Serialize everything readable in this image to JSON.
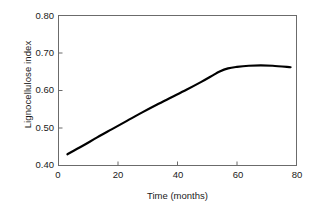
{
  "chart_data": {
    "type": "line",
    "title": "",
    "subtitle": "",
    "xlabel": "Time (months)",
    "ylabel": "Lignocellulose index",
    "xlim": [
      0,
      80
    ],
    "ylim": [
      0.4,
      0.8
    ],
    "xticks": [
      0,
      20,
      40,
      60,
      80
    ],
    "xtick_labels": [
      "0",
      "20",
      "40",
      "60",
      "80"
    ],
    "yticks": [
      0.4,
      0.5,
      0.6,
      0.7,
      0.8
    ],
    "ytick_labels": [
      "0.40",
      "0.50",
      "0.60",
      "0.70",
      "0.80"
    ],
    "grid": false,
    "legend": null,
    "legend_position": "none",
    "annotations": [],
    "line_color": "#000000",
    "line_width": 2.2,
    "axis_color": "#6b6b6b",
    "series": [
      {
        "name": "Lignocellulose index",
        "x": [
          3,
          8,
          13,
          18,
          23,
          28,
          33,
          38,
          43,
          48,
          52,
          54,
          57,
          60,
          64,
          68,
          72,
          78
        ],
        "y": [
          0.43,
          0.452,
          0.475,
          0.497,
          0.519,
          0.541,
          0.562,
          0.582,
          0.602,
          0.623,
          0.641,
          0.65,
          0.659,
          0.663,
          0.666,
          0.667,
          0.666,
          0.662
        ]
      }
    ]
  },
  "axes": {
    "ylabel_text": "Lignocellulose index",
    "xlabel_text": "Time (months)"
  }
}
